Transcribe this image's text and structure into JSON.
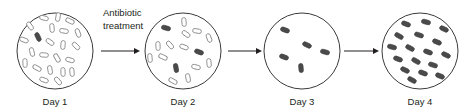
{
  "figure": {
    "width": 475,
    "height": 112,
    "background": "#ffffff",
    "title_text": "",
    "treatment_label": {
      "line1": "Antibiotic",
      "line2": "treatment"
    },
    "colors": {
      "susceptible_fill": "#ffffff",
      "susceptible_stroke": "#8c8c8c",
      "resistant_fill": "#4a4a4a",
      "resistant_stroke": "#3a3a3a",
      "dish_stroke": "#3a3a3a",
      "arrow": "#231f20",
      "text": "#231f20"
    }
  },
  "dishes": [
    {
      "id": "day-1",
      "label": "Day 1",
      "cx": 55,
      "cy": 51,
      "r": 38,
      "resistant_count": 1,
      "susceptible_count": 22,
      "bacteria": [
        {
          "x": 38,
          "y": 37,
          "rot": 65,
          "type": "resistant"
        },
        {
          "x": 44,
          "y": 18,
          "rot": 15,
          "type": "susceptible"
        },
        {
          "x": 58,
          "y": 17,
          "rot": 100,
          "type": "susceptible"
        },
        {
          "x": 70,
          "y": 21,
          "rot": 25,
          "type": "susceptible"
        },
        {
          "x": 30,
          "y": 26,
          "rot": 55,
          "type": "susceptible"
        },
        {
          "x": 52,
          "y": 28,
          "rot": 85,
          "type": "susceptible"
        },
        {
          "x": 64,
          "y": 31,
          "rot": 10,
          "type": "susceptible"
        },
        {
          "x": 78,
          "y": 33,
          "rot": 70,
          "type": "susceptible"
        },
        {
          "x": 24,
          "y": 40,
          "rot": 20,
          "type": "susceptible"
        },
        {
          "x": 50,
          "y": 42,
          "rot": 35,
          "type": "susceptible"
        },
        {
          "x": 63,
          "y": 45,
          "rot": 95,
          "type": "susceptible"
        },
        {
          "x": 76,
          "y": 46,
          "rot": 45,
          "type": "susceptible"
        },
        {
          "x": 32,
          "y": 52,
          "rot": 75,
          "type": "susceptible"
        },
        {
          "x": 44,
          "y": 55,
          "rot": 5,
          "type": "susceptible"
        },
        {
          "x": 57,
          "y": 58,
          "rot": 60,
          "type": "susceptible"
        },
        {
          "x": 70,
          "y": 60,
          "rot": 15,
          "type": "susceptible"
        },
        {
          "x": 25,
          "y": 63,
          "rot": 88,
          "type": "susceptible"
        },
        {
          "x": 37,
          "y": 68,
          "rot": 30,
          "type": "susceptible"
        },
        {
          "x": 50,
          "y": 70,
          "rot": 80,
          "type": "susceptible"
        },
        {
          "x": 63,
          "y": 72,
          "rot": 88,
          "type": "susceptible"
        },
        {
          "x": 44,
          "y": 80,
          "rot": 20,
          "type": "susceptible"
        },
        {
          "x": 58,
          "y": 81,
          "rot": 50,
          "type": "susceptible"
        },
        {
          "x": 72,
          "y": 72,
          "rot": 85,
          "type": "susceptible"
        }
      ]
    },
    {
      "id": "day-2",
      "label": "Day 2",
      "cx": 183,
      "cy": 51,
      "r": 38,
      "resistant_count": 3,
      "susceptible_count": 13,
      "bacteria": [
        {
          "x": 166,
          "y": 28,
          "rot": 15,
          "type": "resistant"
        },
        {
          "x": 199,
          "y": 52,
          "rot": 20,
          "type": "resistant"
        },
        {
          "x": 176,
          "y": 68,
          "rot": 80,
          "type": "resistant"
        },
        {
          "x": 184,
          "y": 22,
          "rot": 85,
          "type": "susceptible"
        },
        {
          "x": 197,
          "y": 31,
          "rot": 10,
          "type": "susceptible"
        },
        {
          "x": 209,
          "y": 38,
          "rot": 70,
          "type": "susceptible"
        },
        {
          "x": 186,
          "y": 34,
          "rot": 35,
          "type": "susceptible"
        },
        {
          "x": 158,
          "y": 46,
          "rot": 88,
          "type": "susceptible"
        },
        {
          "x": 170,
          "y": 45,
          "rot": 50,
          "type": "susceptible"
        },
        {
          "x": 184,
          "y": 47,
          "rot": 20,
          "type": "susceptible"
        },
        {
          "x": 150,
          "y": 58,
          "rot": 85,
          "type": "susceptible"
        },
        {
          "x": 163,
          "y": 57,
          "rot": 25,
          "type": "susceptible"
        },
        {
          "x": 196,
          "y": 67,
          "rot": 15,
          "type": "susceptible"
        },
        {
          "x": 209,
          "y": 63,
          "rot": 85,
          "type": "susceptible"
        },
        {
          "x": 188,
          "y": 78,
          "rot": 80,
          "type": "susceptible"
        },
        {
          "x": 173,
          "y": 81,
          "rot": 30,
          "type": "susceptible"
        }
      ]
    },
    {
      "id": "day-3",
      "label": "Day 3",
      "cx": 302,
      "cy": 51,
      "r": 38,
      "resistant_count": 5,
      "susceptible_count": 0,
      "bacteria": [
        {
          "x": 285,
          "y": 30,
          "rot": 20,
          "type": "resistant"
        },
        {
          "x": 307,
          "y": 45,
          "rot": 25,
          "type": "resistant"
        },
        {
          "x": 325,
          "y": 52,
          "rot": 15,
          "type": "resistant"
        },
        {
          "x": 284,
          "y": 57,
          "rot": 20,
          "type": "resistant"
        },
        {
          "x": 301,
          "y": 68,
          "rot": 85,
          "type": "resistant"
        }
      ]
    },
    {
      "id": "day-4",
      "label": "Day 4",
      "cx": 420,
      "cy": 51,
      "r": 38,
      "resistant_count": 17,
      "susceptible_count": 0,
      "bacteria": [
        {
          "x": 406,
          "y": 24,
          "rot": 20,
          "type": "resistant"
        },
        {
          "x": 426,
          "y": 22,
          "rot": 15,
          "type": "resistant"
        },
        {
          "x": 444,
          "y": 29,
          "rot": 25,
          "type": "resistant"
        },
        {
          "x": 399,
          "y": 36,
          "rot": 30,
          "type": "resistant"
        },
        {
          "x": 419,
          "y": 35,
          "rot": 18,
          "type": "resistant"
        },
        {
          "x": 437,
          "y": 42,
          "rot": 22,
          "type": "resistant"
        },
        {
          "x": 392,
          "y": 47,
          "rot": 15,
          "type": "resistant"
        },
        {
          "x": 410,
          "y": 48,
          "rot": 28,
          "type": "resistant"
        },
        {
          "x": 428,
          "y": 52,
          "rot": 20,
          "type": "resistant"
        },
        {
          "x": 446,
          "y": 55,
          "rot": 25,
          "type": "resistant"
        },
        {
          "x": 398,
          "y": 59,
          "rot": 20,
          "type": "resistant"
        },
        {
          "x": 416,
          "y": 61,
          "rot": 30,
          "type": "resistant"
        },
        {
          "x": 433,
          "y": 65,
          "rot": 18,
          "type": "resistant"
        },
        {
          "x": 405,
          "y": 70,
          "rot": 25,
          "type": "resistant"
        },
        {
          "x": 423,
          "y": 73,
          "rot": 20,
          "type": "resistant"
        },
        {
          "x": 440,
          "y": 76,
          "rot": 22,
          "type": "resistant"
        },
        {
          "x": 412,
          "y": 80,
          "rot": 28,
          "type": "resistant"
        }
      ]
    }
  ],
  "arrows": [
    {
      "id": "arrow-1",
      "x1": 101,
      "x2": 140,
      "y": 51
    },
    {
      "id": "arrow-2",
      "x1": 228,
      "x2": 262,
      "y": 51
    },
    {
      "id": "arrow-3",
      "x1": 344,
      "x2": 379,
      "y": 51
    }
  ]
}
